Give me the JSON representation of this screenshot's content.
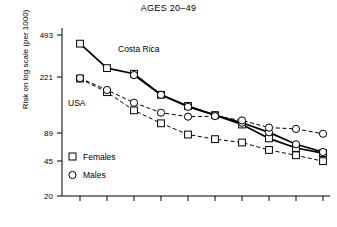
{
  "chart_data": {
    "type": "line",
    "title": "AGES 20–49",
    "xlabel": "",
    "ylabel": "Risk on log scale (per 1000)",
    "y_scale": "log",
    "ylim": [
      20,
      600
    ],
    "y_ticks": [
      493,
      221,
      89,
      45,
      20
    ],
    "y_tick_labels": [
      "493",
      "221",
      "89",
      "45",
      "20"
    ],
    "grid": false,
    "x_ticks_visible": true,
    "x_tick_labels": [
      "",
      "",
      "",
      "",
      "",
      "",
      "",
      "",
      "",
      ""
    ],
    "legend_position": "lower-left",
    "legend": [
      {
        "label": "Females",
        "marker": "square"
      },
      {
        "label": "Males",
        "marker": "circle"
      }
    ],
    "annotations": [
      {
        "text": "Costa Rica",
        "x": 2.35,
        "y": 330
      },
      {
        "text": "USA",
        "x": 0.75,
        "y": 150
      }
    ],
    "x": [
      1,
      2,
      3,
      4,
      5,
      6,
      7,
      8,
      9,
      10
    ],
    "series": [
      {
        "name": "Costa Rica Females",
        "country": "Costa Rica",
        "sex": "Females",
        "marker": "square",
        "line_style": "solid",
        "color": "#000000",
        "values": [
          415,
          255,
          228,
          150,
          120,
          100,
          83,
          63,
          52,
          47
        ]
      },
      {
        "name": "Costa Rica Males",
        "country": "Costa Rica",
        "sex": "Males",
        "marker": "circle",
        "line_style": "solid",
        "color": "#000000",
        "values": [
          null,
          null,
          222,
          150,
          118,
          100,
          86,
          71,
          56,
          48
        ]
      },
      {
        "name": "USA Females",
        "country": "USA",
        "sex": "Females",
        "marker": "square",
        "line_style": "dashed",
        "color": "#000000",
        "values": [
          207,
          158,
          110,
          85,
          68,
          62,
          58,
          50,
          45,
          40
        ]
      },
      {
        "name": "USA Males",
        "country": "USA",
        "sex": "Males",
        "marker": "circle",
        "line_style": "dashed",
        "color": "#000000",
        "values": [
          209,
          165,
          128,
          105,
          97,
          98,
          90,
          78,
          76,
          69
        ]
      }
    ]
  },
  "chart": {
    "title": "AGES 20–49",
    "ylabel": "Risk on log scale (per 1000)",
    "y_tick_labels": [
      "493",
      "221",
      "89",
      "45",
      "20"
    ],
    "annotation_costa_rica": "Costa Rica",
    "annotation_usa": "USA",
    "legend_females": "Females",
    "legend_males": "Males"
  }
}
